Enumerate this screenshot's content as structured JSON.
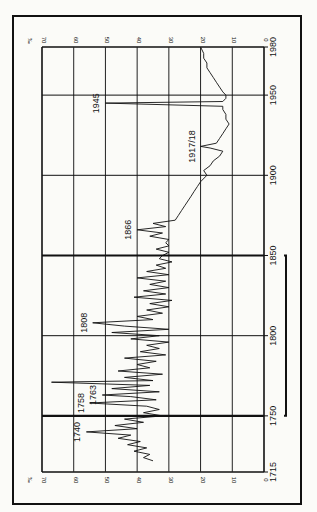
{
  "chart_data": {
    "type": "line",
    "orientation": "rotated-90-ccw",
    "title": "",
    "xlabel": "Year",
    "ylabel": "‰",
    "y_unit": "‰",
    "xlim": [
      1715,
      1980
    ],
    "ylim": [
      0,
      70
    ],
    "x_ticks": [
      1715,
      1750,
      1800,
      1850,
      1900,
      1950,
      1980
    ],
    "y_ticks": [
      0,
      10,
      20,
      30,
      40,
      50,
      60,
      70
    ],
    "grid": true,
    "annotations": [
      {
        "label": "1740",
        "x": 1740,
        "y": 56
      },
      {
        "label": "1758",
        "x": 1758,
        "y": 55
      },
      {
        "label": "1763",
        "x": 1763,
        "y": 51
      },
      {
        "label": "1808",
        "x": 1808,
        "y": 54
      },
      {
        "label": "1866",
        "x": 1866,
        "y": 40
      },
      {
        "label": "1917/18",
        "x": 1918,
        "y": 20
      },
      {
        "label": "1945",
        "x": 1945,
        "y": 50
      }
    ],
    "bracket": {
      "from": 1750,
      "to": 1850
    },
    "x": [
      1722,
      1724,
      1726,
      1728,
      1730,
      1732,
      1734,
      1736,
      1738,
      1740,
      1742,
      1744,
      1746,
      1748,
      1750,
      1752,
      1754,
      1756,
      1758,
      1760,
      1762,
      1763,
      1765,
      1767,
      1769,
      1771,
      1772,
      1774,
      1776,
      1778,
      1780,
      1782,
      1784,
      1786,
      1788,
      1790,
      1792,
      1794,
      1796,
      1798,
      1800,
      1802,
      1804,
      1806,
      1808,
      1810,
      1812,
      1814,
      1816,
      1818,
      1820,
      1822,
      1824,
      1826,
      1828,
      1830,
      1832,
      1834,
      1836,
      1838,
      1840,
      1842,
      1844,
      1846,
      1848,
      1850,
      1852,
      1854,
      1856,
      1858,
      1860,
      1862,
      1864,
      1866,
      1868,
      1870,
      1872,
      1875,
      1878,
      1881,
      1884,
      1887,
      1890,
      1893,
      1896,
      1900,
      1903,
      1906,
      1909,
      1912,
      1915,
      1917,
      1918,
      1920,
      1923,
      1926,
      1929,
      1932,
      1935,
      1938,
      1941,
      1943,
      1945,
      1946,
      1948,
      1950,
      1952,
      1955,
      1958,
      1961,
      1964,
      1967,
      1970,
      1973,
      1976,
      1980
    ],
    "values": [
      35,
      38,
      36,
      41,
      37,
      43,
      39,
      46,
      42,
      56,
      40,
      47,
      38,
      44,
      32,
      38,
      33,
      37,
      55,
      34,
      42,
      51,
      33,
      48,
      36,
      67,
      35,
      44,
      32,
      46,
      36,
      40,
      34,
      44,
      31,
      39,
      33,
      37,
      30,
      42,
      33,
      48,
      30,
      44,
      54,
      35,
      40,
      32,
      37,
      30,
      36,
      29,
      41,
      31,
      38,
      30,
      36,
      31,
      40,
      30,
      37,
      31,
      34,
      29,
      33,
      32,
      30,
      34,
      30,
      31,
      30,
      36,
      32,
      40,
      31,
      35,
      28,
      27,
      26,
      25,
      24,
      23,
      22,
      21,
      20,
      18,
      19,
      17,
      16,
      14,
      13,
      17,
      20,
      15,
      14,
      13,
      12,
      11,
      12,
      12,
      13,
      13,
      50,
      13,
      12,
      12,
      13,
      14,
      15,
      16,
      17,
      18,
      18,
      19,
      19,
      20
    ]
  },
  "axes": {
    "y_unit_label": "‰",
    "y_tick_labels": [
      "0",
      "10",
      "20",
      "30",
      "40",
      "50",
      "60",
      "70"
    ],
    "x_tick_labels": [
      "1715",
      "1750",
      "1800",
      "1850",
      "1900",
      "1950",
      "1980"
    ]
  }
}
